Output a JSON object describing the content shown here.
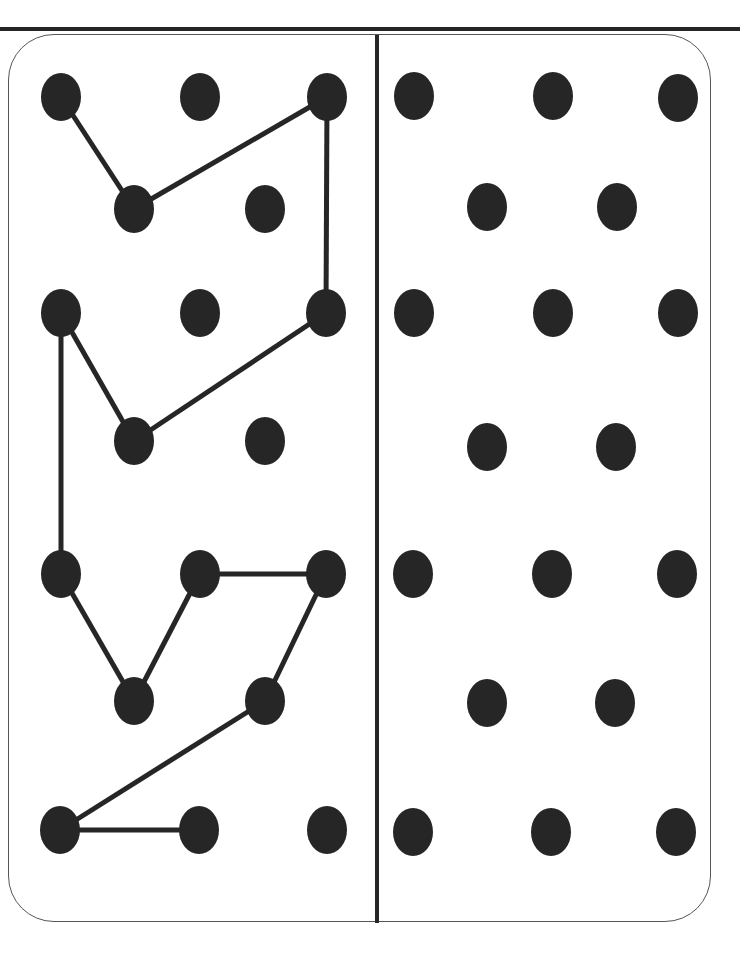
{
  "page": {
    "title": "",
    "colors": {
      "ink": "#262626",
      "frame": "#555555",
      "background": "#ffffff"
    }
  },
  "puzzle": {
    "type": "dot-to-dot copy grid",
    "left_panel": {
      "label": "pattern",
      "dots": [
        {
          "id": "A1",
          "x": 61,
          "y": 97
        },
        {
          "id": "A2",
          "x": 200,
          "y": 97
        },
        {
          "id": "A3",
          "x": 327,
          "y": 97
        },
        {
          "id": "B1",
          "x": 134,
          "y": 209
        },
        {
          "id": "B2",
          "x": 265,
          "y": 209
        },
        {
          "id": "C1",
          "x": 61,
          "y": 313
        },
        {
          "id": "C2",
          "x": 200,
          "y": 313
        },
        {
          "id": "C3",
          "x": 326,
          "y": 313
        },
        {
          "id": "D1",
          "x": 134,
          "y": 441
        },
        {
          "id": "D2",
          "x": 265,
          "y": 441
        },
        {
          "id": "E1",
          "x": 61,
          "y": 574
        },
        {
          "id": "E2",
          "x": 200,
          "y": 574
        },
        {
          "id": "E3",
          "x": 326,
          "y": 574
        },
        {
          "id": "F1",
          "x": 134,
          "y": 701
        },
        {
          "id": "F2",
          "x": 265,
          "y": 701
        },
        {
          "id": "G1",
          "x": 60,
          "y": 830
        },
        {
          "id": "G2",
          "x": 199,
          "y": 830
        },
        {
          "id": "G3",
          "x": 327,
          "y": 830
        }
      ],
      "path": [
        "A1",
        "B1",
        "A3",
        "C3",
        "D1",
        "C1",
        "E1",
        "F1",
        "E2",
        "E3",
        "F2",
        "G1",
        "G2"
      ]
    },
    "right_panel": {
      "label": "copy area",
      "dots": [
        {
          "id": "A1",
          "x": 414,
          "y": 96
        },
        {
          "id": "A2",
          "x": 553,
          "y": 96
        },
        {
          "id": "A3",
          "x": 678,
          "y": 98
        },
        {
          "id": "B1",
          "x": 487,
          "y": 207
        },
        {
          "id": "B2",
          "x": 617,
          "y": 207
        },
        {
          "id": "C1",
          "x": 414,
          "y": 313
        },
        {
          "id": "C2",
          "x": 553,
          "y": 313
        },
        {
          "id": "C3",
          "x": 678,
          "y": 313
        },
        {
          "id": "D1",
          "x": 487,
          "y": 447
        },
        {
          "id": "D2",
          "x": 616,
          "y": 447
        },
        {
          "id": "E1",
          "x": 413,
          "y": 574
        },
        {
          "id": "E2",
          "x": 552,
          "y": 574
        },
        {
          "id": "E3",
          "x": 677,
          "y": 574
        },
        {
          "id": "F1",
          "x": 487,
          "y": 703
        },
        {
          "id": "F2",
          "x": 615,
          "y": 703
        },
        {
          "id": "G1",
          "x": 413,
          "y": 832
        },
        {
          "id": "G2",
          "x": 551,
          "y": 832
        },
        {
          "id": "G3",
          "x": 676,
          "y": 832
        }
      ],
      "path": []
    }
  }
}
